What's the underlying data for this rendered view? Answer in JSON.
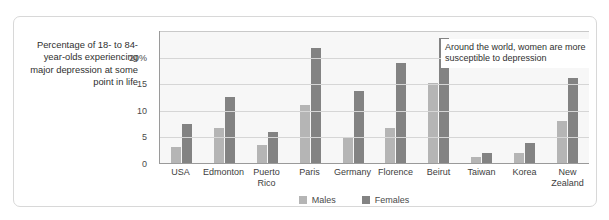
{
  "caption": "Percentage of 18- to 84-year-olds experiencing major depression at some point in life",
  "annotation": "Around the world, women are more susceptible to depression",
  "legend": {
    "items": [
      {
        "label": "Males",
        "color": "#b5b5b5"
      },
      {
        "label": "Females",
        "color": "#838383"
      }
    ]
  },
  "axis": {
    "ticks": [
      {
        "label": "0",
        "value": 0
      },
      {
        "label": "5",
        "value": 5
      },
      {
        "label": "10",
        "value": 10
      },
      {
        "label": "15",
        "value": 15
      },
      {
        "label": "20%",
        "value": 20
      }
    ]
  },
  "chart_data": {
    "type": "bar",
    "title": "",
    "xlabel": "",
    "ylabel": "Percentage of 18- to 84-year-olds experiencing major depression at some point in life",
    "ylim": [
      0,
      25
    ],
    "grid": true,
    "legend_position": "bottom-center",
    "categories": [
      "USA",
      "Edmonton",
      "Puerto Rico",
      "Paris",
      "Germany",
      "Florence",
      "Beirut",
      "Taiwan",
      "Korea",
      "New Zealand"
    ],
    "series": [
      {
        "name": "Males",
        "color": "#b5b5b5",
        "values": [
          3.0,
          6.5,
          3.4,
          10.9,
          4.8,
          6.5,
          15.0,
          1.2,
          1.9,
          7.9
        ]
      },
      {
        "name": "Females",
        "color": "#838383",
        "values": [
          7.3,
          12.5,
          5.9,
          21.6,
          13.6,
          18.8,
          23.5,
          1.8,
          3.8,
          15.9
        ]
      }
    ],
    "annotations": [
      "Around the world, women are more susceptible to depression"
    ]
  }
}
